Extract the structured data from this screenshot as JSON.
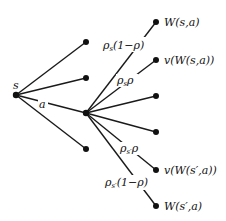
{
  "diagram": {
    "type": "decision-tree",
    "root": {
      "label": "s",
      "x": 16,
      "y": 95
    },
    "action_node": {
      "x": 86,
      "y": 113
    },
    "action_edge_label": "a",
    "root_other_children": [
      {
        "x": 86,
        "y": 42
      },
      {
        "x": 86,
        "y": 78
      },
      {
        "x": 86,
        "y": 149
      }
    ],
    "outcomes": [
      {
        "x": 156,
        "y": 22,
        "edge_label": {
          "rho": "ρ",
          "sub": "s",
          "rest": "(1−ρ)"
        },
        "leaf_label": "W(s,a)"
      },
      {
        "x": 156,
        "y": 60,
        "edge_label": {
          "rho": "ρ",
          "sub": "s",
          "rest": "ρ"
        },
        "leaf_label": "v(W(s,a))"
      },
      {
        "x": 156,
        "y": 96,
        "edge_label": null,
        "leaf_label": ""
      },
      {
        "x": 156,
        "y": 132,
        "edge_label": null,
        "leaf_label": ""
      },
      {
        "x": 156,
        "y": 170,
        "edge_label": {
          "rho": "ρ",
          "sub": "s′",
          "rest": "ρ"
        },
        "leaf_label": "v(W(s′,a))"
      },
      {
        "x": 156,
        "y": 206,
        "edge_label": {
          "rho": "ρ",
          "sub": "s′",
          "rest": "(1−ρ)"
        },
        "leaf_label": "W(s′,a)"
      }
    ],
    "colors": {
      "line": "#1a1a1a",
      "node": "#111111",
      "background": "#ffffff"
    }
  }
}
